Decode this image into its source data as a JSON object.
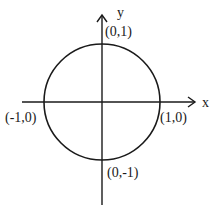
{
  "diagram": {
    "axes": {
      "x_label": "x",
      "y_label": "y"
    },
    "points": [
      {
        "label": "(0,1)"
      },
      {
        "label": "(-1,0)"
      },
      {
        "label": "(1,0)"
      },
      {
        "label": "(0,-1)"
      }
    ],
    "colors": {
      "stroke": "#1a1a1a",
      "background": "#ffffff"
    }
  }
}
